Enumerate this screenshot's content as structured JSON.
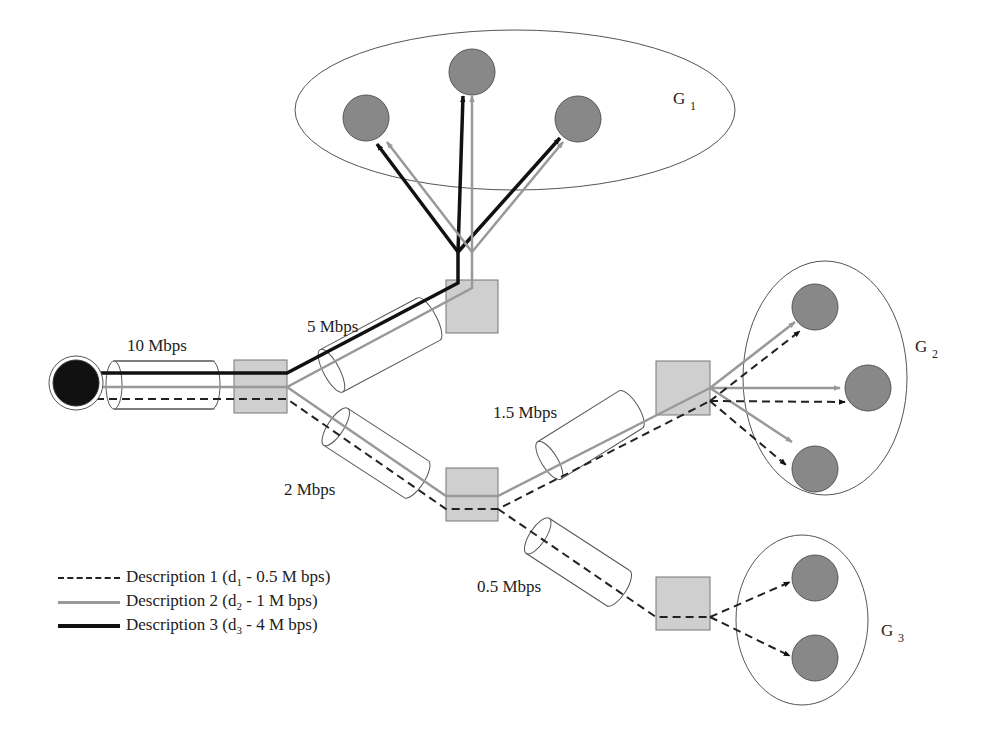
{
  "colors": {
    "description_1": "#222222",
    "description_2": "#999999",
    "description_3": "#111111",
    "router_fill": "#cfcfcf",
    "receiver_fill": "#888888",
    "source_fill": "#111111",
    "group_outline": "#555555"
  },
  "links": [
    {
      "id": "source-r1",
      "label": "10 Mbps"
    },
    {
      "id": "r1-rtop",
      "label": "5 Mbps"
    },
    {
      "id": "r1-rmid",
      "label": "2 Mbps"
    },
    {
      "id": "rmid-rg2",
      "label": "1.5 Mbps"
    },
    {
      "id": "rmid-rg3",
      "label": "0.5 Mbps"
    }
  ],
  "groups": [
    {
      "name": "G",
      "index": "1",
      "receivers": 3,
      "descriptions": [
        "d2",
        "d3"
      ]
    },
    {
      "name": "G",
      "index": "2",
      "receivers": 3,
      "descriptions": [
        "d1",
        "d2"
      ]
    },
    {
      "name": "G",
      "index": "3",
      "receivers": 2,
      "descriptions": [
        "d1"
      ]
    }
  ],
  "legend": [
    {
      "style": "dashed",
      "text": "Description 1 (d",
      "sub": "1",
      "rate": " - 0.5 M bps)"
    },
    {
      "style": "gray",
      "text": "Description 2 (d",
      "sub": "2",
      "rate": " - 1 M bps)"
    },
    {
      "style": "black",
      "text": "Description 3 (d",
      "sub": "3",
      "rate": " - 4 M bps)"
    }
  ]
}
